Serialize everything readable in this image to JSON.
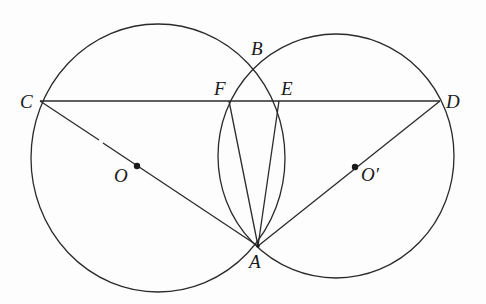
{
  "figure": {
    "colors": {
      "ink": "#2a2a2a",
      "background": "#fdfdfd"
    },
    "circles": [
      {
        "name": "circle-O",
        "center_label": "O",
        "cx": 158,
        "cy": 158,
        "rx": 127,
        "ry": 134
      },
      {
        "name": "circle-O-prime",
        "center_label": "O'",
        "cx": 336,
        "cy": 156,
        "rx": 118,
        "ry": 122
      }
    ],
    "points": {
      "A": {
        "label": "A",
        "x": 258,
        "y": 246
      },
      "B": {
        "label": "B",
        "x": 256,
        "y": 65
      },
      "C": {
        "label": "C",
        "x": 40,
        "y": 101
      },
      "D": {
        "label": "D",
        "x": 440,
        "y": 101
      },
      "E": {
        "label": "E",
        "x": 279,
        "y": 101
      },
      "F": {
        "label": "F",
        "x": 229,
        "y": 101
      },
      "O": {
        "label": "O",
        "x": 137,
        "y": 166
      },
      "Oprime": {
        "label": "O′",
        "x": 355,
        "y": 167
      }
    },
    "segments": [
      "CD",
      "CA",
      "DA",
      "FA",
      "EA"
    ],
    "labels": {
      "A": "A",
      "B": "B",
      "C": "C",
      "D": "D",
      "E": "E",
      "F": "F",
      "O": "O",
      "Oprime": "O′"
    }
  }
}
